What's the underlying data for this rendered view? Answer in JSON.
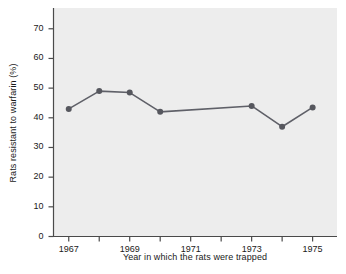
{
  "chart_data": {
    "type": "line",
    "title": "",
    "xlabel": "Year in which the rats were trapped",
    "ylabel": "Rats resistant to warfarin (%)",
    "x": [
      1967,
      1968,
      1969,
      1970,
      1973,
      1974,
      1975
    ],
    "values": [
      43,
      49,
      48.5,
      42,
      44,
      37,
      43.5
    ],
    "series": [
      {
        "name": "Rats resistant to warfarin",
        "values": [
          43,
          49,
          48.5,
          42,
          44,
          37,
          43.5
        ]
      }
    ],
    "xlim": [
      1966.5,
      1975.8
    ],
    "ylim": [
      0,
      77
    ],
    "xticks": [
      1967,
      1968,
      1969,
      1970,
      1971,
      1972,
      1973,
      1974,
      1975
    ],
    "xtick_labels": [
      "1967",
      "",
      "1969",
      "",
      "1971",
      "",
      "1973",
      "",
      "1975"
    ],
    "yticks": [
      0,
      10,
      20,
      30,
      40,
      50,
      60,
      70
    ],
    "ytick_labels": [
      "0",
      "10",
      "20",
      "30",
      "40",
      "50",
      "60",
      "70"
    ],
    "grid": false,
    "legend": "none",
    "marker": "circle",
    "line_color": "#5f6068",
    "marker_color": "#56575e",
    "plot_background": "#ededed",
    "figure_background": "#ffffff",
    "axis_color": "#4a4a4a",
    "text_color": "#1a1a1a"
  }
}
